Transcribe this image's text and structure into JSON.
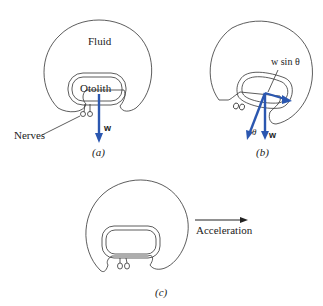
{
  "panels": [
    {
      "id": "a",
      "caption": "(a)",
      "labels": {
        "fluid": "Fluid",
        "otolith": "Otolith",
        "nerves": "Nerves",
        "weight": "w"
      }
    },
    {
      "id": "b",
      "caption": "(b)",
      "labels": {
        "component": "w sin θ",
        "angle": "θ",
        "weight": "w"
      }
    },
    {
      "id": "c",
      "caption": "(c)",
      "labels": {
        "acceleration": "Acceleration"
      }
    }
  ],
  "colors": {
    "vector": "#2b57b0",
    "outline": "#333333"
  }
}
